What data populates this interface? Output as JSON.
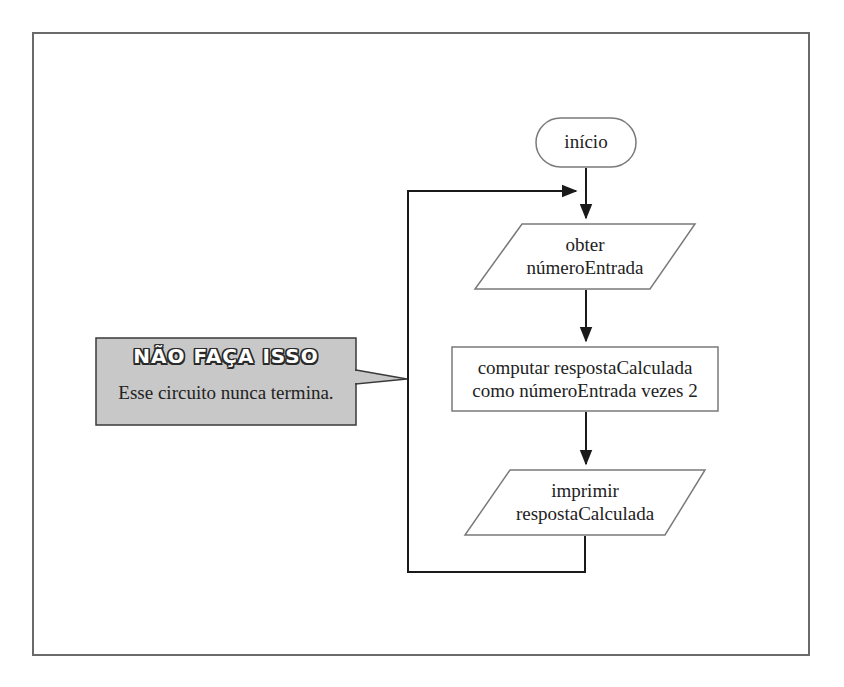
{
  "flowchart": {
    "start": {
      "label": "início",
      "shape": "terminal"
    },
    "input": {
      "line1": "obter",
      "line2": "númeroEntrada",
      "shape": "parallelogram"
    },
    "process": {
      "line1": "computar respostaCalculada",
      "line2": "como númeroEntrada vezes 2",
      "shape": "rectangle"
    },
    "output": {
      "line1": "imprimir",
      "line2": "respostaCalculada",
      "shape": "parallelogram"
    },
    "loop": {
      "description": "output flows back to before input (infinite loop)"
    }
  },
  "callout": {
    "title": "NÃO FAÇA ISSO",
    "text": "Esse circuito nunca termina.",
    "fill_color": "#c8c8c8",
    "border_color": "#3a3a3a"
  },
  "colors": {
    "line": "#1a1a1a",
    "frame": "#6a6a6a",
    "shape_border": "#7a7a7a"
  }
}
